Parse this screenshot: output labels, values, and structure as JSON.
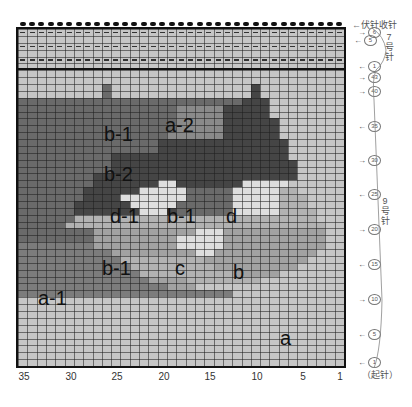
{
  "diagram": {
    "type": "knitting-chart",
    "columns": 35,
    "rows_total": 49,
    "top_label": "伏针收针",
    "needle_sections": [
      {
        "label": "7号针",
        "chars": [
          "7",
          "号",
          "针"
        ],
        "rows": 6,
        "row_labels": [
          "6",
          "5",
          "1"
        ]
      },
      {
        "label": "9号针",
        "chars": [
          "9",
          "号",
          "针"
        ],
        "rows": 43,
        "row_labels": [
          "43",
          "40",
          "35",
          "30",
          "25",
          "20",
          "15",
          "10",
          "5",
          "1"
        ]
      }
    ],
    "cast_on_label": "（起针）",
    "x_ticks": [
      "35",
      "30",
      "25",
      "20",
      "15",
      "10",
      "5",
      "1"
    ],
    "region_labels": [
      {
        "id": "a-2",
        "text": "a-2"
      },
      {
        "id": "b-1-top",
        "text": "b-1"
      },
      {
        "id": "b-2",
        "text": "b-2"
      },
      {
        "id": "d-1",
        "text": "d-1"
      },
      {
        "id": "b-1-mid",
        "text": "b-1"
      },
      {
        "id": "d",
        "text": "d"
      },
      {
        "id": "b-1-low",
        "text": "b-1"
      },
      {
        "id": "c",
        "text": "c"
      },
      {
        "id": "b",
        "text": "b"
      },
      {
        "id": "a-1",
        "text": "a-1"
      },
      {
        "id": "a",
        "text": "a"
      }
    ],
    "colors": {
      "L": "#c6c6c6",
      "A": "#7c7c7c",
      "D": "#6a6a6a",
      "N": "#8a8a8a",
      "K": "#454545",
      "M": "#a2a2a2",
      "W": "#dedede",
      "G": "#b2b2b2"
    },
    "cell_map_top_to_bottom": [
      "LLLLLLLLLLLLLLLLLLLLLLLLLLLLLLLLLLL",
      "LLLLLLLLLLLLLLLLLLLLLLLLLLLLLLLLLLL",
      "LLLLLLLLLLLLLLLLLLLLLLLLLLLLLLLLLLL",
      "LLLLLLLLLLLLLLLLLLLLLLLLLLLLLLLLLLL",
      "LLLLLLLLLLLLLLLLLLLLLLLLLLLLLLLLLLL",
      "LLLLLLLLLLLLLLLLLLLLLLLLLLLLLLLLLLL",
      "LLLLLLLLLLLLLLLLLLLLLLLLLLLLLLLLLLL",
      "LLLLLLLLLLLLLLLLLLLLLLLLLLLLLLLLLLL",
      "LLLLLLLLLDLLLLLLLLLLLLLLLKLLLLLLLLL",
      "LLLLLLLLLDLLLLLLLLLLLLLLLKLLLLLLLLL",
      "DDDDDDDDDDDDDDDDDDDDDDDDKKKLLLLLLLL",
      "DDDDDDDDDDDDDDDDDNNNNNKKKKKLLLLLLLL",
      "DDDDDDDDDDDDDDDDDNNNNNKKKKKLLLLLLLL",
      "DDDDDDDDDDDDDDDDDNNNNNKKKKKKLLLLLLL",
      "DDDDDDDDDDDDDDDDDNNNNNKKKKKKLLLLLLL",
      "DDDDDDDDDDDDDDDDNNNNNNKKKKKKLLLLLLL",
      "DDDDDDDDDDDDDDDKKKKKKKKKKKKKKLLLLLL",
      "DDDDDDDDDDDDDDDKKKKKKKKKKKKKKLLLLLL",
      "DDDDDDDDDDKKKKKKKKKKKKKKKKKKKLLLLLL",
      "DDDDDDDDDDKKKKKKKKKKKKKKKKKKKKLLLLL",
      "DDDDDDDDDDKKKKKKKKKKKKKKKKKKKKLLLLL",
      "DDDDDDDDKKKKKKKKKKKKKKKKKKKKKKLLLLL",
      "DDDDDDDDKKKKKKKWWKKKKKKKWWWWWLLLLLL",
      "DDDDDDDKKKKKKWWWWWDDDDDWWWWWGGLLLLL",
      "DDDDDDDKKKKWWWWWWWDDDDDWWWWWGGGLLLL",
      "DDDDDDKKKKKKWWWWWDDDDDDWWWWWGGGLLLL",
      "DDDDDDKKKKKKKWWWKDDDDDDWWWWWGGGGLLL",
      "DDDDDDGGGGGGGGGGGGGGGGGGGGGGGGGGLLL",
      "DDDDDGGGGGGGGGGGGGGGGGGGGGGGGGGGGLL",
      "DDDDDDDDMMMMMMMMMMMWWWMMMMMMMMMMMLL",
      "DDDDDDDDMMMMMMMMMWWWWWMMMMMMMMMMMLL",
      "AAAAAAAAMMMMMMMMMWWWWWMMMMMMMMMMMLL",
      "AAAAAAAAAAMMMMMMMMMWWMMMMMMMMMMMLLL",
      "AAAAAAAAAAAGGGGGGGGGMMMMMMMMMMMLLLL",
      "AAAAAAAAAAAAGGGGGGGGGMMMMMMMMMLLLLL",
      "AAAAAAAAAAAAAGGGGGGGGGGMMMMMLLLLLLL",
      "AAAAAAAAAAAAAAMMMMGGGGGGGGLLLLLLLLL",
      "AAAAAAAAAAAAAAAAMMMLLLLLLLLLLLLLLLL",
      "AAAAAAAAAAAAAAAAAAAAAAALLLLLLLLLLLL",
      "LLLLLLLLLLLLLLLLLLLLLLLLLLLLLLLLLLL",
      "LLLLLLLLLLLLLLLLLLLLLLLLLLLLLLLLLLL",
      "LLLLLLLLLLLLLLLLLLLLLLLLLLLLLLLLLLL",
      "LLLLLLLLLLLLLLLLLLLLLLLLLLLLLLLLLLL",
      "LLLLLLLLLLLLLLLLLLLLLLLLLLLLLLLLLLL",
      "LLLLLLLLLLLLLLLLLLLLLLLLLLLLLLLLLLL",
      "LLLLLLLLLLLLLLLLLLLLLLLLLLLLLLLLLLL",
      "LLLLLLLLLLLLLLLLLLLLLLLLLLLLLLLLLLL",
      "LLLLLLLLLLLLLLLLLLLLLLLLLLLLLLLLLLL",
      "LLLLLLLLLLLLLLLLLLLLLLLLLLLLLLLLLLL"
    ],
    "purl_rows_from_top": [
      0,
      2,
      4
    ]
  }
}
